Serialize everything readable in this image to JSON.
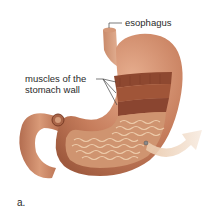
{
  "figure": {
    "panel_label": "a.",
    "labels": {
      "esophagus": "esophagus",
      "muscles_line1": "muscles of the",
      "muscles_line2": "stomach wall"
    },
    "colors": {
      "outer_wall": "#c47a5a",
      "outer_highlight": "#e0a585",
      "muscle_band": "#8f4a32",
      "lining": "#d9a27c",
      "rugae": "#f1d2b0",
      "arrow": "#f0d9c4",
      "leader_line": "#444444"
    }
  }
}
